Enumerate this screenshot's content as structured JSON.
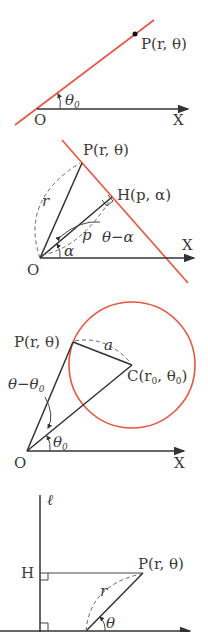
{
  "colors": {
    "curve": "#e8553f",
    "ink": "#333333",
    "background": "#ffffff"
  },
  "diagrams": [
    {
      "id": "line-through-origin",
      "labels": {
        "point": "P(r, θ)",
        "origin": "O",
        "axis": "X",
        "angle": "θ",
        "angle_sub": "0"
      }
    },
    {
      "id": "line-with-foot-of-perpendicular",
      "labels": {
        "point": "P(r, θ)",
        "foot": "H(p, α)",
        "origin": "O",
        "axis": "X",
        "r": "r",
        "p": "p",
        "angle_alpha": "α",
        "angle_diff": "θ−α"
      }
    },
    {
      "id": "circle",
      "labels": {
        "point": "P(r, θ)",
        "center": "C(r",
        "center_sub": "0",
        "center_mid": ", θ",
        "center_sub2": "0",
        "center_end": ")",
        "radius": "a",
        "origin": "O",
        "axis": "X",
        "angle": "θ",
        "angle_sub": "0",
        "angle_diff": "θ−θ",
        "angle_diff_sub": "0"
      }
    },
    {
      "id": "conic-directrix",
      "labels": {
        "directrix": "ℓ",
        "foot": "H",
        "point": "P(r, θ)",
        "r": "r",
        "angle": "θ"
      }
    }
  ]
}
